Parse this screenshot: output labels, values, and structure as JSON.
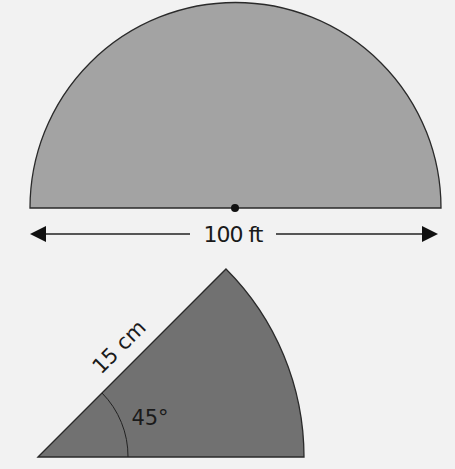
{
  "colors": {
    "background": "#f2f2f2",
    "semicircle_fill": "#a3a3a3",
    "sector_fill": "#717171",
    "stroke": "#2a2a2a"
  },
  "semicircle": {
    "diameter_label": "100 ft",
    "center_dot": true
  },
  "sector": {
    "radius_label": "15 cm",
    "angle_label": "45°"
  }
}
